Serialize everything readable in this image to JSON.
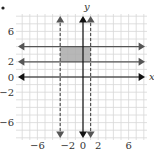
{
  "chart_data": {
    "type": "line",
    "title": "",
    "xlabel": "x",
    "ylabel": "y",
    "xlim": [
      -8,
      8
    ],
    "ylim": [
      -8,
      8
    ],
    "grid": true,
    "grid_step": 1,
    "x_tick_labels": [
      "−6",
      "−2",
      "0",
      "2",
      "6"
    ],
    "x_ticks": [
      -6,
      -2,
      0,
      2,
      6
    ],
    "y_tick_labels": [
      "6",
      "2",
      "0",
      "−2",
      "−6"
    ],
    "y_ticks": [
      6,
      2,
      0,
      -2,
      -6
    ],
    "series": [
      {
        "name": "y = 4",
        "kind": "horizontal",
        "value": 4,
        "style": "solid",
        "color": "#555555"
      },
      {
        "name": "y = 2",
        "kind": "horizontal",
        "value": 2,
        "style": "solid",
        "color": "#555555"
      },
      {
        "name": "x = -3",
        "kind": "vertical",
        "value": -3,
        "style": "dashed",
        "color": "#555555"
      },
      {
        "name": "x = 1",
        "kind": "vertical",
        "value": 1,
        "style": "dashed",
        "color": "#555555"
      }
    ],
    "shaded_region": {
      "x": [
        -3,
        1
      ],
      "y": [
        2,
        4
      ],
      "color": "#aaaaaa"
    },
    "legend": null
  },
  "labels": {
    "x_axis": "x",
    "y_axis": "y",
    "bullet": "•"
  },
  "colors": {
    "grid": "#d8d8d8",
    "axis": "#111111",
    "line": "#555555",
    "shade": "#aaaaaa"
  }
}
